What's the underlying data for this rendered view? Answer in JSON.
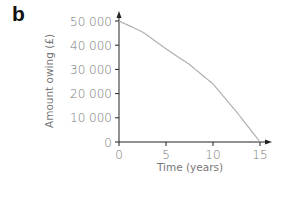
{
  "panel_label": "b",
  "chart_data": {
    "type": "line",
    "title": "",
    "xlabel": "Time (years)",
    "ylabel": "Amount owing (£)",
    "xlim": [
      0,
      15
    ],
    "ylim": [
      0,
      50000
    ],
    "x_ticks": [
      "0",
      "5",
      "10",
      "15"
    ],
    "y_ticks": [
      "0",
      "10 000",
      "20 000",
      "30 000",
      "40 000",
      "50 000"
    ],
    "grid": false,
    "legend": null,
    "series": [
      {
        "name": "Amount owing",
        "x": [
          0,
          2.5,
          5,
          7.5,
          10,
          12.5,
          15
        ],
        "values": [
          50000,
          45500,
          38500,
          32000,
          24000,
          12500,
          0
        ]
      }
    ]
  },
  "colors": {
    "axis": "#222222",
    "curve": "#b0b0b0",
    "text": "#777777"
  }
}
